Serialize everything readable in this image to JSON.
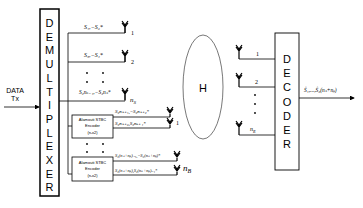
{
  "diagram": {
    "type": "block-diagram",
    "input": {
      "label_line1": "DATA",
      "label_line2": "Tx"
    },
    "demultiplexer": {
      "letters": [
        "D",
        "E",
        "M",
        "U",
        "L",
        "T",
        "I",
        "P",
        "L",
        "E",
        "X",
        "E",
        "R"
      ]
    },
    "sm_branches": [
      {
        "symbols": "S₁,−S₂*",
        "antenna_label": "1"
      },
      {
        "symbols": "S₃,−S₄*",
        "antenna_label": "2"
      },
      {
        "symbols": "S₂nₛ₋₁,−S₂nₛ*",
        "antenna_label": "n_S"
      }
    ],
    "sm_last_antenna_label": "n",
    "sm_last_antenna_sub": "S",
    "stbc_encoders": [
      {
        "label_line1": "Alamouti STBC",
        "label_line2": "Encoder",
        "label_line3": "(nᵣx2)",
        "out_top": "S₂nₛ₊₁,−S₂nₛ₊₂*",
        "out_bottom": "S₂nₛ₊₂,S₂nₛ₊₁*",
        "antenna_label": "1"
      },
      {
        "label_line1": "Alamouti STBC",
        "label_line2": "Encoder",
        "label_line3": "(nᵣx2)",
        "out_top": "S₂(nₛ+nᵦ)₋₁,−S₂(nₛ+nᵦ)*",
        "out_bottom": "S₂(nₛ+nᵦ),S₂(nₛ+nᵦ)₋₁*",
        "antenna_label": "n_B"
      }
    ],
    "stbc_last_antenna_label": "n",
    "stbc_last_antenna_sub": "B",
    "channel": {
      "label": "H"
    },
    "receiver": {
      "antennas": [
        {
          "label": "1"
        },
        {
          "label": "2"
        },
        {
          "label": "n",
          "sub": "R"
        }
      ]
    },
    "decoder": {
      "letters": [
        "D",
        "E",
        "C",
        "O",
        "D",
        "E",
        "R"
      ]
    },
    "output": {
      "label": "Ŝ₁,...,Ŝ₂(nₛ+nᵦ)"
    },
    "colors": {
      "line": "#000000",
      "ellipse": "#555555",
      "background": "#ffffff"
    }
  }
}
